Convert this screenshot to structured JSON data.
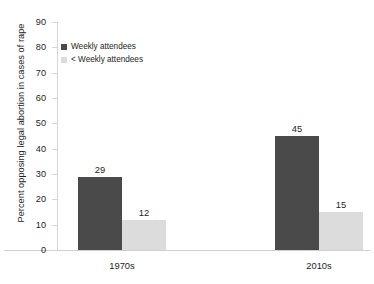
{
  "chart_data": {
    "type": "bar",
    "title": "",
    "xlabel": "",
    "ylabel": "Percent opposing legal abortion in cases of rape",
    "categories": [
      "1970s",
      "2010s"
    ],
    "series": [
      {
        "name": "Weekly attendees",
        "values": [
          29,
          45
        ],
        "color": "#4a4a4a"
      },
      {
        "name": "< Weekly attendees",
        "values": [
          12,
          15
        ],
        "color": "#dcdcdc"
      }
    ],
    "ylim": [
      0,
      90
    ],
    "yticks": [
      0,
      10,
      20,
      30,
      40,
      50,
      60,
      70,
      80,
      90
    ],
    "ytick_labels": [
      "0",
      "10",
      "20",
      "30",
      "40",
      "50",
      "60",
      "70",
      "80",
      "90"
    ],
    "grid": false,
    "legend_position": "top-left-inside",
    "data_labels": true,
    "background": "#ffffff"
  },
  "legend": {
    "items": [
      {
        "label": "Weekly attendees"
      },
      {
        "label": "< Weekly attendees"
      }
    ]
  },
  "axis": {
    "y_title": "Percent opposing legal abortion in cases of rape"
  },
  "bars": [
    {
      "value_label": "29",
      "category": "1970s",
      "series": "Weekly attendees"
    },
    {
      "value_label": "12",
      "category": "1970s",
      "series": "< Weekly attendees"
    },
    {
      "value_label": "45",
      "category": "2010s",
      "series": "Weekly attendees"
    },
    {
      "value_label": "15",
      "category": "2010s",
      "series": "< Weekly attendees"
    }
  ]
}
